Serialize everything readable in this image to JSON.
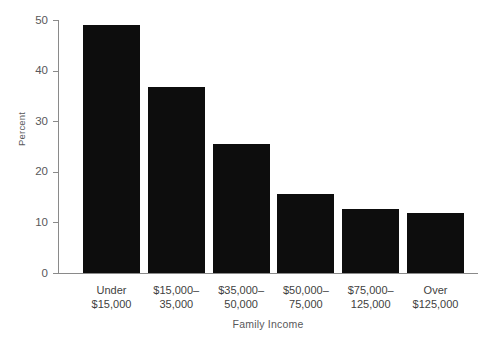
{
  "chart_data": {
    "type": "bar",
    "title": "",
    "subtitle": "",
    "xlabel": "Family Income",
    "ylabel": "Percent",
    "categories": [
      "Under\n$15,000",
      "$15,000–\n35,000",
      "$35,000–\n50,000",
      "$50,000–\n75,000",
      "$75,000–\n125,000",
      "Over\n$125,000"
    ],
    "values": [
      49.0,
      36.8,
      25.5,
      15.6,
      12.6,
      11.8
    ],
    "ylim": [
      0,
      50
    ],
    "yticks": [
      0,
      10,
      20,
      30,
      40,
      50
    ],
    "ytick_labels": [
      "0",
      "10",
      "20",
      "30",
      "40",
      "50"
    ],
    "grid": false,
    "legend": "none",
    "bar_color": "#0d0d0d",
    "axis_color": "#8a8a8a",
    "background_color": "#ffffff"
  }
}
